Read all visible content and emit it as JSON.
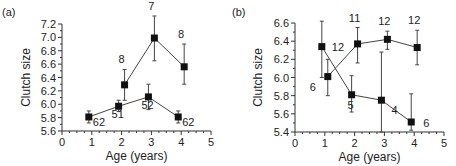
{
  "chart_data": [
    {
      "panel": "(a)",
      "type": "line",
      "title": "",
      "xlabel": "Age (years)",
      "ylabel": "Clutch size",
      "xlim": [
        0,
        5
      ],
      "ylim": [
        5.6,
        7.2
      ],
      "xticks": [
        0,
        1,
        2,
        3,
        4,
        5
      ],
      "yticks": [
        5.6,
        5.8,
        6.0,
        6.2,
        6.4,
        6.6,
        6.8,
        7.0,
        7.2
      ],
      "grid": false,
      "legend": "none",
      "series": [
        {
          "name": "lower",
          "x": [
            0.9,
            1.9,
            2.9,
            3.9
          ],
          "values": [
            5.81,
            5.97,
            6.11,
            5.81
          ],
          "err_low": [
            5.72,
            5.89,
            5.92,
            5.72
          ],
          "err_high": [
            5.9,
            6.06,
            6.3,
            5.9
          ],
          "labels": [
            "62",
            "51",
            "52",
            "62"
          ]
        },
        {
          "name": "upper",
          "x": [
            2.1,
            3.1,
            4.1
          ],
          "values": [
            6.29,
            6.99,
            6.56
          ],
          "err_low": [
            6.06,
            6.65,
            6.3
          ],
          "err_high": [
            6.52,
            7.32,
            6.9
          ],
          "labels": [
            "8",
            "7",
            "8"
          ]
        }
      ]
    },
    {
      "panel": "(b)",
      "type": "line",
      "title": "",
      "xlabel": "Age (years)",
      "ylabel": "Clutch size",
      "xlim": [
        0,
        5
      ],
      "ylim": [
        5.4,
        6.6
      ],
      "xticks": [
        0,
        1,
        2,
        3,
        4,
        5
      ],
      "yticks": [
        5.4,
        5.6,
        5.8,
        6.0,
        6.2,
        6.4,
        6.6
      ],
      "grid": false,
      "legend": "none",
      "series": [
        {
          "name": "declining",
          "x": [
            0.9,
            1.9,
            2.9,
            3.9
          ],
          "values": [
            6.34,
            5.81,
            5.75,
            5.51
          ],
          "err_low": [
            6.0,
            5.62,
            5.4,
            5.42
          ],
          "err_high": [
            6.62,
            6.02,
            6.28,
            5.82
          ],
          "labels": [
            "12",
            "5",
            "4",
            "6"
          ]
        },
        {
          "name": "rising",
          "x": [
            1.1,
            2.1,
            3.1,
            4.1
          ],
          "values": [
            6.01,
            6.37,
            6.42,
            6.33
          ],
          "err_low": [
            5.8,
            6.16,
            6.31,
            6.14
          ],
          "err_high": [
            6.2,
            6.55,
            6.51,
            6.52
          ],
          "labels": [
            "6",
            "11",
            "12",
            "12"
          ]
        }
      ]
    }
  ]
}
